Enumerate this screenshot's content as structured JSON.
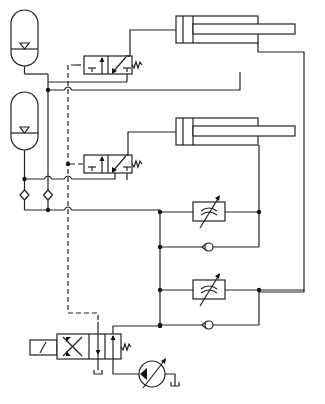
{
  "diagram": {
    "title": "Hydraulic circuit with two accumulators, two cylinders, flow controls and pump",
    "colors": {
      "line": "#222222",
      "background": "#ffffff"
    },
    "components": {
      "accumulators": [
        {
          "id": "accumulator-1",
          "label": "Accumulator 1"
        },
        {
          "id": "accumulator-2",
          "label": "Accumulator 2"
        }
      ],
      "cylinders": [
        {
          "id": "cylinder-1",
          "label": "Double-acting cylinder 1"
        },
        {
          "id": "cylinder-2",
          "label": "Double-acting cylinder 2"
        }
      ],
      "valves": [
        {
          "id": "valve-3-2-upper",
          "label": "3/2 pilot-operated valve (upper), spring return"
        },
        {
          "id": "valve-3-2-lower",
          "label": "3/2 pilot-operated valve (lower), spring return"
        },
        {
          "id": "valve-solenoid",
          "label": "Solenoid-operated directional valve, spring return"
        }
      ],
      "flow_controls": [
        {
          "id": "throttle-upper",
          "label": "Adjustable throttle (upper)"
        },
        {
          "id": "throttle-lower",
          "label": "Adjustable throttle (lower)"
        }
      ],
      "check_valves": [
        {
          "id": "check-upper",
          "label": "Check valve (upper bypass)"
        },
        {
          "id": "check-lower",
          "label": "Check valve (lower bypass)"
        },
        {
          "id": "check-acc-1",
          "label": "Check valve (accumulator 1)"
        },
        {
          "id": "check-acc-2",
          "label": "Check valve (accumulator 2)"
        }
      ],
      "pump": {
        "id": "pump",
        "label": "Variable displacement pump"
      },
      "tanks": [
        {
          "id": "tank-valve",
          "label": "Tank"
        },
        {
          "id": "tank-pump",
          "label": "Tank"
        }
      ],
      "pilot_line": {
        "label": "Pilot line (dashed)"
      }
    }
  }
}
